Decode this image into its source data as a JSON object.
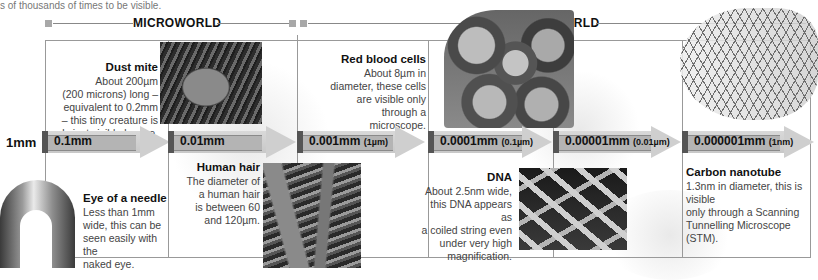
{
  "intro_text": "s of thousands of times to be visible.",
  "sections": {
    "microworld": {
      "title": "MICROWORLD"
    },
    "nanoworld": {
      "title": "NANOWORLD"
    }
  },
  "scale": {
    "start_label": "1mm",
    "steps": [
      {
        "value": "0.1mm",
        "unit": ""
      },
      {
        "value": "0.01mm",
        "unit": ""
      },
      {
        "value": "0.001mm",
        "unit": "(1µm)"
      },
      {
        "value": "0.0001mm",
        "unit": "(0.1µm)"
      },
      {
        "value": "0.00001mm",
        "unit": "(0.01µm)"
      },
      {
        "value": "0.000001mm",
        "unit": "(1nm)"
      }
    ]
  },
  "items": {
    "dust_mite": {
      "title": "Dust mite",
      "text": [
        "About 200µm",
        "(200 microns) long –",
        "equivalent to 0.2mm",
        "– this tiny creature is",
        "only just visible by eye."
      ]
    },
    "red_blood_cells": {
      "title": "Red blood cells",
      "text": [
        "About 8µm in",
        "diameter, these cells",
        "are visible only",
        "through a microscope."
      ]
    },
    "eye_of_needle": {
      "title": "Eye of a needle",
      "text": [
        "Less than 1mm",
        "wide, this can be",
        "seen easily with the",
        "naked eye."
      ]
    },
    "human_hair": {
      "title": "Human hair",
      "text": [
        "The diameter of",
        "a human hair",
        "is between 60",
        "and 120µm."
      ]
    },
    "dna": {
      "title": "DNA",
      "text": [
        "About 2.5nm wide,",
        "this DNA appears as",
        "a coiled string even",
        "under very high",
        "magnification."
      ]
    },
    "carbon_nanotube": {
      "title": "Carbon nanotube",
      "text": [
        "1.3nm in diameter, this is visible",
        "only through a Scanning",
        "Tunnelling Microscope (STM)."
      ]
    }
  }
}
